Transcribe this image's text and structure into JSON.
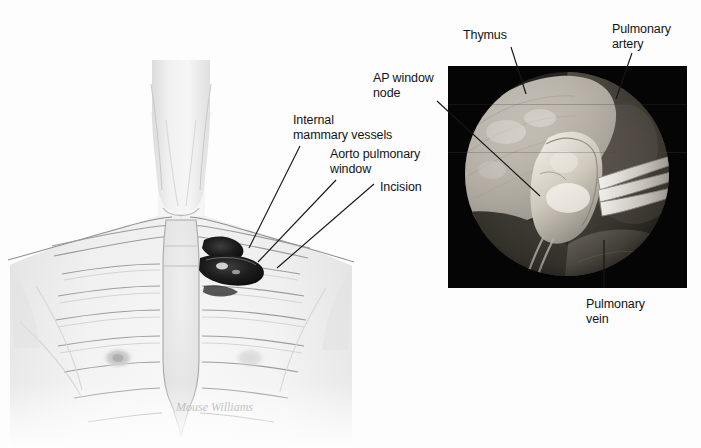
{
  "figure": {
    "background_color": "#fdfdfd",
    "width": 701,
    "height": 448,
    "signature": "Mouse Williams"
  },
  "panels": {
    "illustration": {
      "name": "anterior-chest-illustration",
      "description": "Grayscale anterior chest and neck illustration showing ribcage, sternum, and a small left parasternal incision",
      "line_color": "#6e6e6e",
      "skin_fill": "#f2f2f2",
      "incision_color": "#262626"
    },
    "endoscope": {
      "name": "thoracoscopic-photo",
      "description": "Thoracoscopic circular endoscopic photograph of the aorto-pulmonary window",
      "frame_color": "#050505",
      "left": 448,
      "top": 66,
      "width": 239,
      "height": 222
    }
  },
  "labels": [
    {
      "id": "internal-mammary-vessels",
      "text": "Internal\nmammary vessels",
      "x": 293,
      "y": 113,
      "align": "left"
    },
    {
      "id": "aorto-pulmonary-window",
      "text": "Aorto pulmonary\nwindow",
      "x": 330,
      "y": 147,
      "align": "left"
    },
    {
      "id": "incision",
      "text": "Incision",
      "x": 380,
      "y": 180,
      "align": "left"
    },
    {
      "id": "ap-window-node",
      "text": "AP window\nnode",
      "x": 373,
      "y": 71,
      "align": "left"
    },
    {
      "id": "thymus",
      "text": "Thymus",
      "x": 463,
      "y": 28,
      "align": "left"
    },
    {
      "id": "pulmonary-artery",
      "text": "Pulmonary\nartery",
      "x": 612,
      "y": 22,
      "align": "left"
    },
    {
      "id": "pulmonary-vein",
      "text": "Pulmonary\nvein",
      "x": 586,
      "y": 297,
      "align": "left"
    }
  ],
  "leader_lines": [
    {
      "id": "leader-internal-mammary-vessels",
      "x1": 300,
      "y1": 146,
      "x2": 249,
      "y2": 248
    },
    {
      "id": "leader-aorto-pulmonary-window",
      "x1": 336,
      "y1": 180,
      "x2": 258,
      "y2": 262
    },
    {
      "id": "leader-incision",
      "x1": 374,
      "y1": 184,
      "x2": 277,
      "y2": 268
    },
    {
      "id": "leader-ap-window-node",
      "x1": 437,
      "y1": 101,
      "x2": 540,
      "y2": 196
    },
    {
      "id": "leader-thymus",
      "x1": 511,
      "y1": 47,
      "x2": 526,
      "y2": 94
    },
    {
      "id": "leader-pulmonary-artery",
      "x1": 632,
      "y1": 53,
      "x2": 616,
      "y2": 99
    },
    {
      "id": "leader-pulmonary-vein",
      "x1": 604,
      "y1": 288,
      "x2": 604,
      "y2": 240
    }
  ],
  "colors": {
    "leader_line": "#161616",
    "text": "#141414",
    "panel_black": "#050505",
    "tissue_light": "#d8d4cc",
    "tissue_mid": "#9a958c",
    "tissue_dark": "#4a463f"
  }
}
